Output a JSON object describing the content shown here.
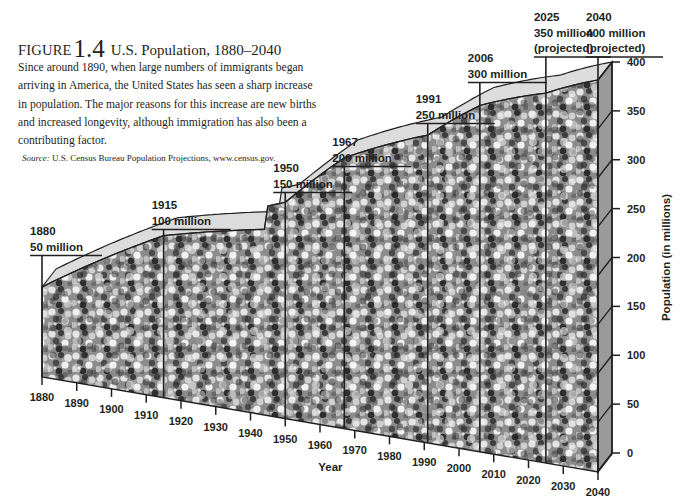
{
  "caption": {
    "figure_word": "FIGURE",
    "figure_number": "1.4",
    "title": "U.S. Population, 1880–2040",
    "description": "Since around 1890, when large numbers of immigrants began arriving in America, the United States has seen a sharp increase in population. The major reasons for this increase are new births and increased longevity, although immigration has also been a contributing factor.",
    "source_label": "Source:",
    "source_text": "U.S. Census Bureau Population Projections, www.census.gov."
  },
  "chart_data": {
    "type": "area",
    "title": "U.S. Population, 1880–2040",
    "xlabel": "Year",
    "ylabel": "Population (in millions)",
    "x_ticks": [
      "1880",
      "1890",
      "1900",
      "1910",
      "1920",
      "1930",
      "1940",
      "1950",
      "1960",
      "1970",
      "1980",
      "1990",
      "2000",
      "2010",
      "2020",
      "2030",
      "2040"
    ],
    "y_ticks": [
      "0",
      "50",
      "100",
      "150",
      "200",
      "250",
      "300",
      "350",
      "400"
    ],
    "ylim": [
      0,
      400
    ],
    "xlim": [
      1880,
      2040
    ],
    "grid": false,
    "style": "3D area filled with crowd photograph",
    "x": [
      1880,
      1915,
      1950,
      1967,
      1991,
      2006,
      2025,
      2040
    ],
    "values": [
      50,
      100,
      150,
      200,
      250,
      300,
      350,
      400
    ],
    "annotations": [
      {
        "year": "1880",
        "value": "50 million",
        "projected": ""
      },
      {
        "year": "1915",
        "value": "100 million",
        "projected": ""
      },
      {
        "year": "1950",
        "value": "150 million",
        "projected": ""
      },
      {
        "year": "1967",
        "value": "200 million",
        "projected": ""
      },
      {
        "year": "1991",
        "value": "250 million",
        "projected": ""
      },
      {
        "year": "2006",
        "value": "300 million",
        "projected": ""
      },
      {
        "year": "2025",
        "value": "350 million",
        "projected": "(projected)"
      },
      {
        "year": "2040",
        "value": "400 million",
        "projected": "(projected)"
      }
    ]
  },
  "colors": {
    "ink": "#231f20",
    "top_face": "#dcdcdc",
    "right_face": "#9a9a9a",
    "crowd_dark": "#3a3a3a",
    "crowd_mid": "#8a8a8a",
    "crowd_light": "#e2e2e2"
  }
}
